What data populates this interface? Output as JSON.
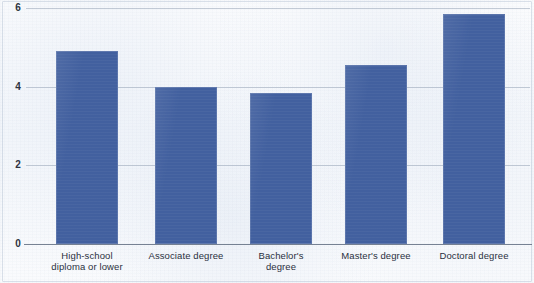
{
  "chart_data": {
    "type": "bar",
    "title": "",
    "xlabel": "",
    "ylabel": "",
    "categories": [
      "High-school diploma or lower",
      "Associate degree",
      "Bachelor's degree",
      "Master's degree",
      "Doctoral degree"
    ],
    "category_lines": [
      [
        "High-school",
        "diploma or lower"
      ],
      [
        "Associate degree",
        ""
      ],
      [
        "Bachelor's",
        "degree"
      ],
      [
        "Master's degree",
        ""
      ],
      [
        "Doctoral degree",
        ""
      ]
    ],
    "values": [
      4.9,
      4.0,
      3.85,
      4.55,
      5.85
    ],
    "ylim": [
      0,
      6
    ],
    "yticks": [
      "0",
      "2",
      "4",
      "6"
    ],
    "ytick_values": [
      0,
      2,
      4,
      6
    ],
    "grid": true,
    "legend": "none",
    "bar_color": "#42609f",
    "gridline_color": "#8e9baf",
    "axis_color": "#5f6c80",
    "background_color": "#fafbfd"
  }
}
